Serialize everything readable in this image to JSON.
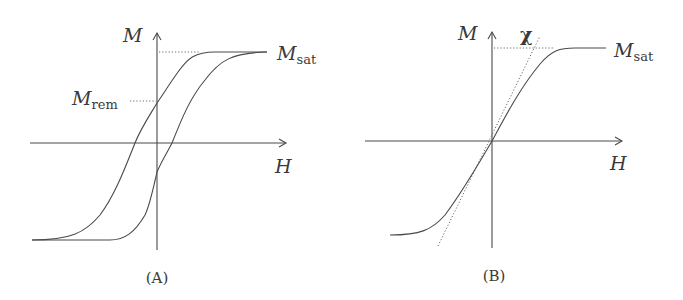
{
  "panels": [
    {
      "id": "A",
      "caption": "(A)",
      "y_axis_label": "M",
      "x_axis_label": "H",
      "sat_label": {
        "main": "M",
        "sub": "sat"
      },
      "rem_label": {
        "main": "M",
        "sub": "rem"
      },
      "description": "Hysteresis loop of a ferromagnet showing saturation and remanent magnetization"
    },
    {
      "id": "B",
      "caption": "(B)",
      "y_axis_label": "M",
      "x_axis_label": "H",
      "sat_label": {
        "main": "M",
        "sub": "sat"
      },
      "slope_label": "χ",
      "description": "Anhysteretic magnetization curve with initial susceptibility χ tangent line"
    }
  ],
  "colors": {
    "line": "#4a4a4a",
    "text": "#3a3a3a",
    "background": "#ffffff"
  }
}
